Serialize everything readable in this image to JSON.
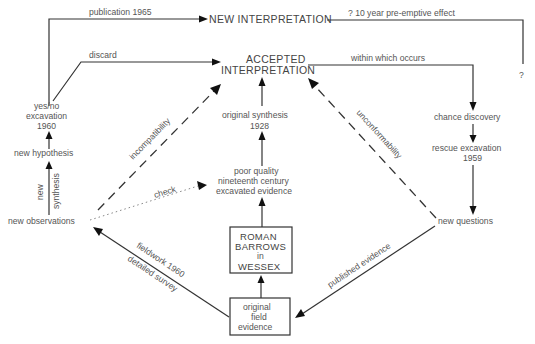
{
  "diagram": {
    "nodes": {
      "new_interpretation": "NEW INTERPRETATION",
      "accepted_line1": "ACCEPTED",
      "accepted_line2": "INTERPRETATION",
      "yesno_line1": "yes/no",
      "yesno_line2": "excavation",
      "yesno_line3": "1960",
      "new_hypothesis": "new hypothesis",
      "new_observations": "new observations",
      "original_synthesis_line1": "original synthesis",
      "original_synthesis_line2": "1928",
      "poor_quality_line1": "poor quality",
      "poor_quality_line2": "nineteenth century",
      "poor_quality_line3": "excavated evidence",
      "roman_line1": "ROMAN",
      "roman_line2": "BARROWS",
      "roman_line3": "in",
      "roman_line4": "WESSEX",
      "field_line1": "original",
      "field_line2": "field",
      "field_line3": "evidence",
      "chance_discovery": "chance discovery",
      "rescue_line1": "rescue excavation",
      "rescue_line2": "1959",
      "new_questions": "new questions",
      "question_mark": "?"
    },
    "edge_labels": {
      "publication": "publication 1965",
      "preemptive": "? 10 year pre-emptive effect",
      "discard": "discard",
      "within": "within which occurs",
      "incompatibility": "incompatibility",
      "unconformability": "unconformability",
      "check": "check",
      "new_synthesis_a": "new",
      "new_synthesis_b": "synthesis",
      "fieldwork": "fieldwork 1960",
      "detailed_survey": "detailed survey",
      "published_evidence": "published evidence"
    }
  }
}
